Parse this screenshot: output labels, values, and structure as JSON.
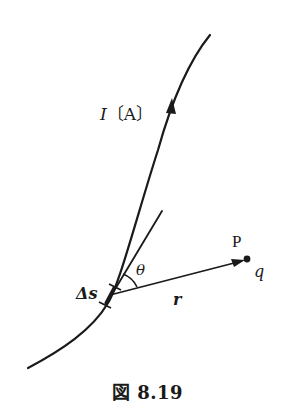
{
  "figure": {
    "caption": "図 8.19",
    "labels": {
      "current_symbol": "I",
      "current_unit": "〔A〕",
      "angle": "θ",
      "segment": "Δs",
      "vector": "r",
      "point": "P",
      "charge": "q"
    },
    "elements": [
      "current-carrying wire (curve) with arrow indicating current direction",
      "tangent line at segment Δs",
      "position vector r from Δs to point P",
      "angle θ between tangent and r",
      "point P with charge q"
    ],
    "colors": {
      "ink": "#1a1a1a",
      "background": "#ffffff"
    }
  }
}
